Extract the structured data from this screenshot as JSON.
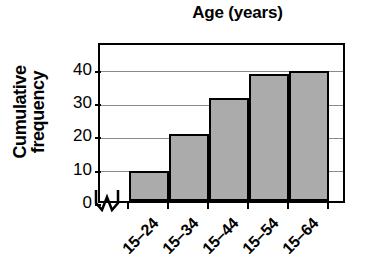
{
  "chart_data": {
    "type": "bar",
    "title": "Age (years)",
    "xlabel": "",
    "ylabel": "Cumulative frequency",
    "ylabel_lines": [
      "Cumulative",
      "frequency"
    ],
    "categories": [
      "15–24",
      "15–34",
      "15–44",
      "15–54",
      "15–64"
    ],
    "values": [
      9,
      20,
      31,
      38,
      39
    ],
    "yticks": [
      0,
      10,
      20,
      30,
      40
    ],
    "ytick_labels": [
      "0",
      "10",
      "20",
      "30",
      "40"
    ],
    "ylim": [
      0,
      48
    ],
    "grid": "horizontal",
    "legend": "none",
    "axis_break": true,
    "bar_fill_color": "#ababab",
    "bar_edge_color": "#000000",
    "gridline_color": "#8a8a8a",
    "axis_color": "#000000",
    "background_color": "#ffffff"
  }
}
